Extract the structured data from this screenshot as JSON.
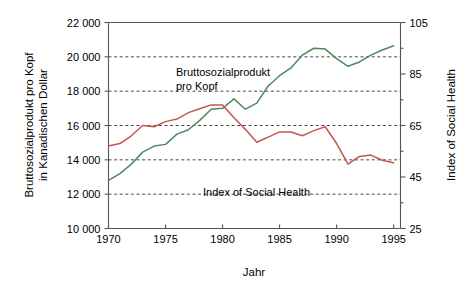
{
  "chart_data": {
    "type": "line",
    "title": "",
    "xlabel": "Jahr",
    "ylabel_left": "Bruttosozialprodukt pro Kopf in Kanadischen Dollar",
    "ylabel_left_line1": "Bruttosozialprodukt pro Kopf",
    "ylabel_left_line2": "in Kanadischen Dollar",
    "ylabel_right": "Index of Social Health",
    "grid": true,
    "legend_position": "inline-annotations",
    "x": [
      1970,
      1971,
      1972,
      1973,
      1974,
      1975,
      1976,
      1977,
      1978,
      1979,
      1980,
      1981,
      1982,
      1983,
      1984,
      1985,
      1986,
      1987,
      1988,
      1989,
      1990,
      1991,
      1992,
      1993,
      1994,
      1995
    ],
    "xlim": [
      1970,
      1995.6
    ],
    "xticks": [
      1970,
      1975,
      1980,
      1985,
      1990,
      1995
    ],
    "xticklabels": [
      "1970",
      "1975",
      "1980",
      "1985",
      "1990",
      "1995"
    ],
    "ylim_left": [
      10000,
      22000
    ],
    "yticks_left": [
      10000,
      12000,
      14000,
      16000,
      18000,
      20000,
      22000
    ],
    "yticklabels_left": [
      "10 000",
      "12 000",
      "14 000",
      "16 000",
      "18 000",
      "20 000",
      "22 000"
    ],
    "ylim_right": [
      25,
      105
    ],
    "yticks_right": [
      25,
      45,
      65,
      85,
      105
    ],
    "yticklabels_right": [
      "25",
      "45",
      "65",
      "85",
      "105"
    ],
    "series": [
      {
        "name": "Bruttosozialprodukt pro Kopf",
        "axis": "left",
        "color": "#4f8a5f",
        "label_line1": "Bruttosozialprodukt",
        "label_line2": "pro Kopf",
        "values": [
          12800,
          13200,
          13750,
          14450,
          14800,
          14900,
          15500,
          15750,
          16300,
          16950,
          17000,
          17550,
          16950,
          17300,
          18300,
          18900,
          19350,
          20100,
          20500,
          20450,
          19900,
          19450,
          19700,
          20100,
          20400,
          20650
        ]
      },
      {
        "name": "Index of Social Health",
        "axis": "right",
        "color": "#c4564f",
        "label": "Index of Social Health",
        "values": [
          57,
          58,
          61,
          65,
          64.5,
          66.5,
          67.5,
          70,
          71.5,
          73,
          73,
          68,
          63.5,
          58.5,
          60.5,
          62.5,
          62.5,
          61,
          63,
          64.5,
          58,
          50,
          53,
          53.5,
          51.5,
          50.5
        ]
      }
    ]
  },
  "axis_text": {
    "x_title": "Jahr",
    "left_title_line1": "Bruttosozialprodukt pro Kopf",
    "left_title_line2": "in Kanadischen Dollar",
    "right_title": "Index of Social Health"
  },
  "annotations": {
    "gnp_label_line1": "Bruttosozialprodukt",
    "gnp_label_line2": "pro Kopf",
    "ish_label": "Index of Social Health"
  },
  "colors": {
    "gnp_line": "#4f8a5f",
    "ish_line": "#c4564f",
    "axis": "#555555",
    "grid": "#333333",
    "background": "#ffffff"
  }
}
